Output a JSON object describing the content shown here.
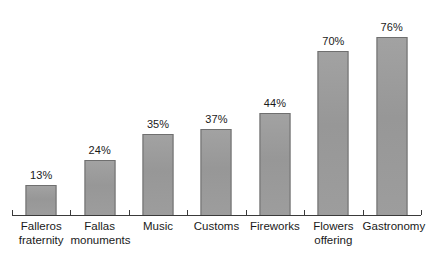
{
  "chart_data": {
    "type": "bar",
    "title": "",
    "subtitle": "",
    "xlabel": "",
    "ylabel": "",
    "ylim": [
      0,
      80
    ],
    "grid": false,
    "legend": false,
    "value_label_suffix": "%",
    "orientation": "vertical",
    "bar_color": "#9c9c9c",
    "bar_border_color": "#6f6f6f",
    "axis_color": "#3a3a3a",
    "background_color": "#ffffff",
    "categories": [
      "Falleros fraternity",
      "Fallas monuments",
      "Music",
      "Customs",
      "Fireworks",
      "Flowers offering",
      "Gastronomy"
    ],
    "values": [
      13,
      24,
      35,
      37,
      44,
      70,
      76
    ],
    "value_labels": [
      "13%",
      "24%",
      "35%",
      "37%",
      "44%",
      "70%",
      "76%"
    ],
    "category_lines": [
      [
        "Falleros",
        "fraternity"
      ],
      [
        "Fallas",
        "monuments"
      ],
      [
        "Music",
        ""
      ],
      [
        "Customs",
        ""
      ],
      [
        "Fireworks",
        ""
      ],
      [
        "Flowers",
        "offering"
      ],
      [
        "Gastronomy",
        ""
      ]
    ]
  }
}
